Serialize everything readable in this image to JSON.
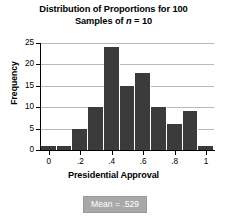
{
  "chart_data": {
    "type": "bar",
    "title": "Distribution of Proportions for 100 Samples of n = 10",
    "title_lines": [
      "Distribution of Proportions for 100",
      "Samples of "
    ],
    "title_italic_token": "n",
    "title_line2_tail": " = 10",
    "xlabel": "Presidential Approval",
    "ylabel": "Frequency",
    "categories": [
      "0",
      "0.1",
      "0.2",
      "0.3",
      "0.4",
      "0.5",
      "0.6",
      "0.7",
      "0.8",
      "0.9",
      "1"
    ],
    "values": [
      1,
      1,
      5,
      10,
      24,
      15,
      18,
      10,
      6,
      9,
      1
    ],
    "bin_width": 0.1,
    "xlim": [
      -0.05,
      1.05
    ],
    "ylim": [
      0,
      25
    ],
    "xticks": [
      0,
      0.2,
      0.4,
      0.6,
      0.8,
      1
    ],
    "xtick_labels": [
      "0",
      ".2",
      ".4",
      ".6",
      ".8",
      "1"
    ],
    "yticks": [
      0,
      5,
      10,
      15,
      20,
      25
    ],
    "ytick_labels": [
      "0",
      "5",
      "10",
      "15",
      "20",
      "25"
    ],
    "grid": true,
    "grid_axis": "y",
    "legend": false,
    "bar_color": "#3b3b3b",
    "grid_color": "#b9b9b9",
    "annotation": {
      "text": "Mean = .529",
      "mean": 0.529,
      "box_color": "#a8a8a8",
      "text_color": "#ffffff"
    }
  }
}
